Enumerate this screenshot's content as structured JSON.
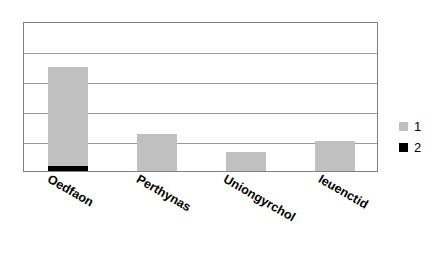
{
  "chart_data": {
    "type": "bar",
    "title": "",
    "xlabel": "",
    "ylabel": "",
    "categories": [
      "Oedfaon",
      "Perthynas",
      "Uniongyrchol",
      "Ieuenctid"
    ],
    "series": [
      {
        "name": "1",
        "color": "#C0C0C0",
        "values": [
          3.3,
          1.22,
          0.62,
          1.0
        ]
      },
      {
        "name": "2",
        "color": "#000000",
        "values": [
          0.17,
          0,
          0,
          0
        ]
      }
    ],
    "stacked": true,
    "ylim": [
      0,
      5
    ],
    "yticks": [
      0,
      1,
      2,
      3,
      4,
      5
    ],
    "grid": true,
    "grid_horizontal_only": true,
    "y_tick_labels_visible": false,
    "legend": {
      "position": "right",
      "entries": [
        {
          "label": "1",
          "color": "#C0C0C0"
        },
        {
          "label": "2",
          "color": "#000000"
        }
      ]
    },
    "xtick_rotation_deg": 30,
    "plot_background": "#ffffff",
    "plot_border_color": "#808080",
    "gridline_color": "#9a9a9a"
  }
}
